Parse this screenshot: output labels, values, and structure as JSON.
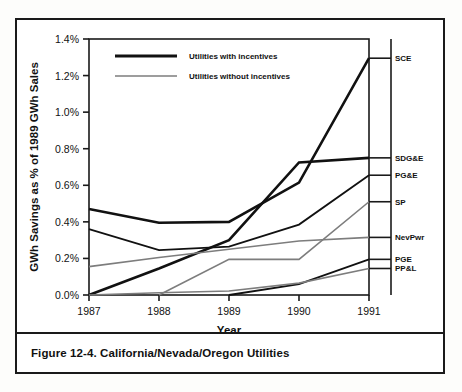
{
  "figure": {
    "caption": "Figure 12-4.  California/Nevada/Oregon Utilities"
  },
  "axes": {
    "y_title": "GWh Savings as % of 1989 GWh Sales",
    "x_title": "Year",
    "y_ticks": [
      "0.0%",
      "0.2%",
      "0.4%",
      "0.6%",
      "0.8%",
      "1.0%",
      "1.2%",
      "1.4%"
    ],
    "x_ticks": [
      "1987",
      "1988",
      "1989",
      "1990",
      "1991"
    ]
  },
  "legend": {
    "items": [
      {
        "label": "Utilities with incentives",
        "style": "thick-black",
        "color": "#111111"
      },
      {
        "label": "Utilities without incentives",
        "style": "thin-gray",
        "color": "#7d7d7d"
      }
    ]
  },
  "series_labels": [
    {
      "key": "SCE",
      "label": "SCE"
    },
    {
      "key": "SDG&E",
      "label": "SDG&E"
    },
    {
      "key": "PG&E",
      "label": "PG&E"
    },
    {
      "key": "SP",
      "label": "SP"
    },
    {
      "key": "NevPwr",
      "label": "NevPwr"
    },
    {
      "key": "PGE",
      "label": "PGE"
    },
    {
      "key": "PP&L",
      "label": "PP&L"
    }
  ],
  "chart_data": {
    "type": "line",
    "title": "Figure 12-4.  California/Nevada/Oregon Utilities",
    "xlabel": "Year",
    "ylabel": "GWh Savings as % of 1989 GWh Sales",
    "x": [
      1987,
      1988,
      1989,
      1990,
      1991
    ],
    "xlim": [
      1987,
      1991
    ],
    "ylim": [
      0.0,
      1.4
    ],
    "y_tick_values": [
      0.0,
      0.2,
      0.4,
      0.6,
      0.8,
      1.0,
      1.2,
      1.4
    ],
    "y_unit": "percent",
    "grid": false,
    "legend_position": "top-left-inside",
    "series_label_position": "right-of-axis",
    "series": [
      {
        "name": "SCE",
        "group": "Utilities with incentives",
        "color": "#111111",
        "width": 2.6,
        "values": [
          0.47,
          0.395,
          0.4,
          0.615,
          1.295
        ]
      },
      {
        "name": "SDG&E",
        "group": "Utilities with incentives",
        "color": "#111111",
        "width": 2.6,
        "values": [
          0.0,
          0.145,
          0.3,
          0.725,
          0.75
        ]
      },
      {
        "name": "PG&E",
        "group": "Utilities with incentives",
        "color": "#111111",
        "width": 1.8,
        "values": [
          0.36,
          0.245,
          0.265,
          0.385,
          0.655
        ]
      },
      {
        "name": "SP",
        "group": "Utilities without incentives",
        "color": "#7d7d7d",
        "width": 1.6,
        "values": [
          null,
          0.0,
          0.195,
          0.195,
          0.51
        ]
      },
      {
        "name": "NevPwr",
        "group": "Utilities without incentives",
        "color": "#7d7d7d",
        "width": 1.6,
        "values": [
          0.155,
          0.205,
          0.25,
          0.295,
          0.315
        ]
      },
      {
        "name": "PGE",
        "group": "Utilities with incentives",
        "color": "#111111",
        "width": 1.8,
        "values": [
          null,
          null,
          0.0,
          0.06,
          0.195
        ]
      },
      {
        "name": "PP&L",
        "group": "Utilities without incentives",
        "color": "#7d7d7d",
        "width": 1.6,
        "values": [
          0.0,
          0.012,
          0.022,
          0.065,
          0.145
        ]
      }
    ]
  }
}
